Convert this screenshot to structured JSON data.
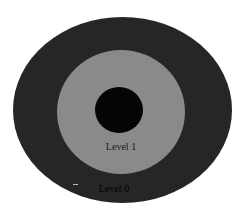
{
  "diagram": {
    "type": "concentric-levels",
    "rings": [
      {
        "name": "outer",
        "label": "Level 0",
        "color": "#262626"
      },
      {
        "name": "middle",
        "label": "Level 1",
        "color": "#8a8a8a"
      },
      {
        "name": "core",
        "label": "",
        "color": "#050505"
      }
    ],
    "labels": {
      "level1": "Level 1",
      "level0": "Level 0"
    }
  }
}
